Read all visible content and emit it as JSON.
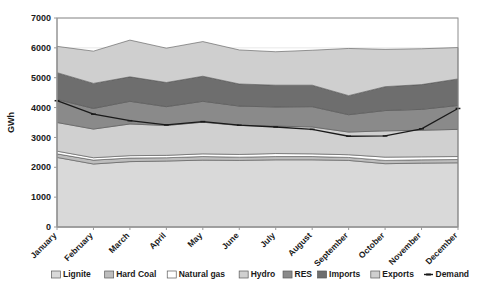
{
  "chart_data": {
    "type": "area",
    "title": "",
    "xlabel": "",
    "ylabel": "GWh",
    "ylim": [
      0,
      7000
    ],
    "ytick_step": 1000,
    "yticks": [
      "0",
      "1000",
      "2000",
      "3000",
      "4000",
      "5000",
      "6000",
      "7000"
    ],
    "grid": true,
    "legend_position": "bottom",
    "stacked": true,
    "categories": [
      "January",
      "February",
      "March",
      "April",
      "May",
      "June",
      "July",
      "August",
      "September",
      "October",
      "November",
      "December"
    ],
    "series": [
      {
        "name": "Lignite",
        "color": "#d9d9d9",
        "values": [
          2330,
          2110,
          2190,
          2210,
          2240,
          2230,
          2250,
          2250,
          2230,
          2120,
          2140,
          2150
        ]
      },
      {
        "name": "Hard Coal",
        "color": "#bdbdbd",
        "values": [
          120,
          130,
          120,
          110,
          120,
          110,
          110,
          110,
          100,
          110,
          110,
          110
        ]
      },
      {
        "name": "Natural gas",
        "color": "#ffffff",
        "values": [
          90,
          80,
          80,
          80,
          90,
          90,
          100,
          90,
          90,
          110,
          100,
          100
        ]
      },
      {
        "name": "Hydro",
        "color": "#d0d0d0",
        "values": [
          960,
          960,
          1060,
          1000,
          1060,
          970,
          920,
          900,
          760,
          880,
          890,
          910
        ]
      },
      {
        "name": "RES",
        "color": "#8a8a8a",
        "values": [
          770,
          690,
          760,
          630,
          700,
          650,
          640,
          680,
          580,
          680,
          700,
          800
        ]
      },
      {
        "name": "Imports",
        "color": "#6e6e6e",
        "values": [
          900,
          840,
          820,
          810,
          840,
          740,
          730,
          720,
          640,
          800,
          830,
          890
        ]
      },
      {
        "name": "Exports",
        "color": "#cfcfcf",
        "values": [
          880,
          1080,
          1230,
          1150,
          1160,
          1140,
          1120,
          1170,
          1580,
          1250,
          1200,
          1050
        ]
      }
    ],
    "line_series": {
      "name": "Demand",
      "color": "#1a1a1a",
      "marker": "dash",
      "values": [
        4230,
        3780,
        3560,
        3420,
        3530,
        3410,
        3350,
        3270,
        3040,
        3050,
        3290,
        3970
      ]
    }
  },
  "legend": {
    "items": [
      {
        "label": "Lignite",
        "swatch": "#d9d9d9",
        "type": "box"
      },
      {
        "label": "Hard Coal",
        "swatch": "#bdbdbd",
        "type": "box"
      },
      {
        "label": "Natural gas",
        "swatch": "#ffffff",
        "type": "box"
      },
      {
        "label": "Hydro",
        "swatch": "#d0d0d0",
        "type": "box"
      },
      {
        "label": "RES",
        "swatch": "#8a8a8a",
        "type": "box"
      },
      {
        "label": "Imports",
        "swatch": "#6e6e6e",
        "type": "box"
      },
      {
        "label": "Exports",
        "swatch": "#cfcfcf",
        "type": "box"
      },
      {
        "label": "Demand",
        "swatch": "#1a1a1a",
        "type": "line"
      }
    ]
  }
}
